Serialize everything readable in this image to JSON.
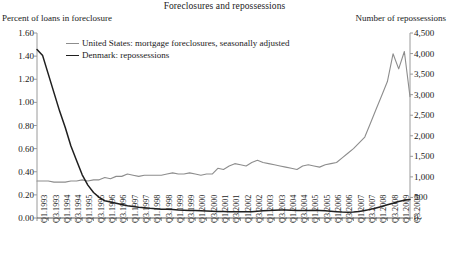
{
  "chart_data": {
    "type": "line",
    "title": "Foreclosures and repossessions",
    "ylabel": "Percent of loans in foreclosure",
    "ylabel_right": "Number of repossessions",
    "xlabel": "",
    "ylim": [
      0.0,
      1.6
    ],
    "ylim_right": [
      0,
      4500
    ],
    "yticks": [
      "0.00",
      "0.20",
      "0.40",
      "0.60",
      "0.80",
      "1.00",
      "1.20",
      "1.40",
      "1.60"
    ],
    "yticks_right": [
      "0",
      "500",
      "1,000",
      "1,500",
      "2,000",
      "2,500",
      "3,000",
      "3,500",
      "4,000",
      "4,500"
    ],
    "grid": false,
    "legend_position": "top-center",
    "categories": [
      "Q1.1993",
      "Q2.1993",
      "Q3.1993",
      "Q4.1993",
      "Q1.1994",
      "Q2.1994",
      "Q3.1994",
      "Q4.1994",
      "Q1.1995",
      "Q2.1995",
      "Q3.1995",
      "Q4.1995",
      "Q1.1996",
      "Q2.1996",
      "Q3.1996",
      "Q4.1996",
      "Q1.1997",
      "Q2.1997",
      "Q3.1997",
      "Q4.1997",
      "Q1.1998",
      "Q2.1998",
      "Q3.1998",
      "Q4.1998",
      "Q1.1999",
      "Q2.1999",
      "Q3.1999",
      "Q4.1999",
      "Q1.2000",
      "Q2.2000",
      "Q3.2000",
      "Q4.2000",
      "Q1.2001",
      "Q2.2001",
      "Q3.2001",
      "Q4.2001",
      "Q1.2002",
      "Q2.2002",
      "Q3.2002",
      "Q4.2002",
      "Q1.2003",
      "Q2.2003",
      "Q3.2003",
      "Q4.2003",
      "Q1.2004",
      "Q2.2004",
      "Q3.2004",
      "Q4.2004",
      "Q1.2005",
      "Q2.2005",
      "Q3.2005",
      "Q4.2005",
      "Q1.2006",
      "Q2.2006",
      "Q3.2006",
      "Q4.2006",
      "Q1.2007",
      "Q2.2007",
      "Q3.2007",
      "Q4.2007",
      "Q1.2008",
      "Q2.2008",
      "Q3.2008",
      "Q4.2008",
      "Q1.2009",
      "Q2.2009",
      "Q3.2009"
    ],
    "xtick_labels": [
      "Q1.1993",
      "Q3.1993",
      "Q1.1994",
      "Q3.1994",
      "Q1.1995",
      "Q3.1995",
      "Q1.1996",
      "Q3.1996",
      "Q1.1997",
      "Q3.1997",
      "Q1.1998",
      "Q3.1998",
      "Q1.1999",
      "Q3.1999",
      "Q1.2000",
      "Q3.2000",
      "Q1.2001",
      "Q3.2001",
      "Q1.2002",
      "Q3.2002",
      "Q1.2003",
      "Q3.2003",
      "Q1.2004",
      "Q3.2004",
      "Q1.2005",
      "Q3.2005",
      "Q1.2006",
      "Q3.2006",
      "Q1.2007",
      "Q3.2007",
      "Q1.2008",
      "Q3.2008",
      "Q1.2009",
      "Q3.2009"
    ],
    "series": [
      {
        "name": "United States: mortgage foreclosures, seasonally adjusted",
        "axis": "left",
        "color": "#8d8d8d",
        "units": "percent of loans in foreclosure",
        "values": [
          0.32,
          0.32,
          0.32,
          0.31,
          0.31,
          0.31,
          0.32,
          0.32,
          0.33,
          0.32,
          0.33,
          0.33,
          0.35,
          0.34,
          0.36,
          0.36,
          0.38,
          0.37,
          0.36,
          0.37,
          0.37,
          0.37,
          0.37,
          0.38,
          0.39,
          0.38,
          0.38,
          0.39,
          0.38,
          0.37,
          0.38,
          0.38,
          0.43,
          0.42,
          0.45,
          0.47,
          0.46,
          0.45,
          0.48,
          0.5,
          0.48,
          0.47,
          0.46,
          0.45,
          0.44,
          0.43,
          0.42,
          0.45,
          0.46,
          0.45,
          0.44,
          0.46,
          0.47,
          0.48,
          0.52,
          0.56,
          0.6,
          0.65,
          0.7,
          0.82,
          0.94,
          1.06,
          1.18,
          1.42,
          1.29,
          1.44,
          1.05
        ]
      },
      {
        "name": "Denmark: repossessions",
        "axis": "right",
        "color": "#1f1f1f",
        "units": "number of repossessions",
        "values": [
          4100,
          3950,
          3500,
          3050,
          2600,
          2200,
          1750,
          1400,
          1050,
          800,
          620,
          500,
          420,
          390,
          360,
          330,
          300,
          280,
          260,
          250,
          235,
          225,
          215,
          210,
          205,
          195,
          190,
          185,
          180,
          175,
          170,
          165,
          160,
          158,
          155,
          152,
          150,
          150,
          155,
          165,
          175,
          185,
          190,
          195,
          195,
          190,
          185,
          180,
          185,
          190,
          185,
          175,
          165,
          155,
          145,
          140,
          145,
          160,
          180,
          210,
          245,
          280,
          320,
          360,
          400,
          430,
          450
        ]
      }
    ]
  }
}
